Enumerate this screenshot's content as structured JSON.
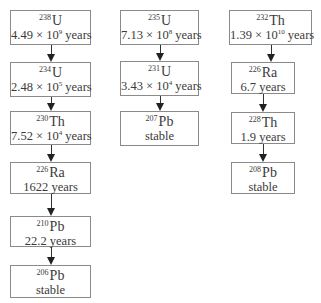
{
  "diagram": {
    "title": "",
    "chains": [
      {
        "name": "uranium-238-series",
        "nodes": [
          {
            "mass": "238",
            "symbol": "U",
            "halflife": "4.49 × 10",
            "exp": "9",
            "unit": " years"
          },
          {
            "mass": "234",
            "symbol": "U",
            "halflife": "2.48 × 10",
            "exp": "5",
            "unit": " years"
          },
          {
            "mass": "230",
            "symbol": "Th",
            "halflife": "7.52 × 10",
            "exp": "4",
            "unit": " years"
          },
          {
            "mass": "226",
            "symbol": "Ra",
            "halflife": "1622 years",
            "exp": "",
            "unit": ""
          },
          {
            "mass": "210",
            "symbol": "Pb",
            "halflife": "22.2 years",
            "exp": "",
            "unit": ""
          },
          {
            "mass": "206",
            "symbol": "Pb",
            "halflife": "stable",
            "exp": "",
            "unit": ""
          }
        ]
      },
      {
        "name": "uranium-235-series",
        "nodes": [
          {
            "mass": "235",
            "symbol": "U",
            "halflife": "7.13 × 10",
            "exp": "8",
            "unit": " years"
          },
          {
            "mass": "231",
            "symbol": "U",
            "halflife": "3.43 × 10",
            "exp": "4",
            "unit": " years"
          },
          {
            "mass": "207",
            "symbol": "Pb",
            "halflife": "stable",
            "exp": "",
            "unit": ""
          }
        ]
      },
      {
        "name": "thorium-232-series",
        "nodes": [
          {
            "mass": "232",
            "symbol": "Th",
            "halflife": "1.39 × 10",
            "exp": "10",
            "unit": " years"
          },
          {
            "mass": "226",
            "symbol": "Ra",
            "halflife": "6.7 years",
            "exp": "",
            "unit": ""
          },
          {
            "mass": "228",
            "symbol": "Th",
            "halflife": "1.9 years",
            "exp": "",
            "unit": ""
          },
          {
            "mass": "208",
            "symbol": "Pb",
            "halflife": "stable",
            "exp": "",
            "unit": ""
          }
        ]
      }
    ]
  }
}
